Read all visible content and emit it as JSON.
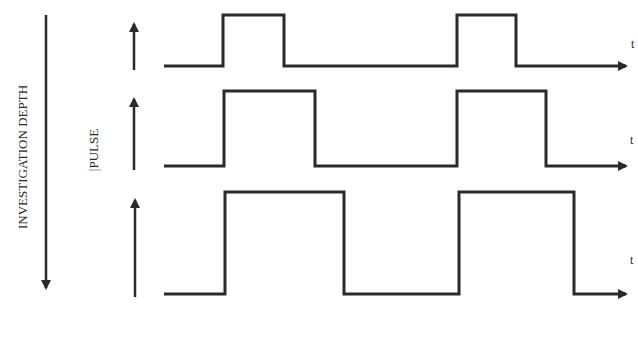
{
  "labels": {
    "depth_axis": "INVESTIGATION DEPTH",
    "pulse_axis": "|PULSE",
    "time_axis": "t"
  },
  "colors": {
    "stroke": "#2a2a2a",
    "background": "#ffffff"
  },
  "rows": [
    {
      "name": "shallow",
      "baseline_y": 66,
      "high_y": 15,
      "pulses": [
        [
          223,
          284
        ],
        [
          457,
          516
        ]
      ],
      "t_label": "t"
    },
    {
      "name": "middle",
      "baseline_y": 166,
      "high_y": 91,
      "pulses": [
        [
          224,
          315
        ],
        [
          457,
          546
        ]
      ],
      "t_label": "t"
    },
    {
      "name": "deep",
      "baseline_y": 294,
      "high_y": 192,
      "pulses": [
        [
          225,
          344
        ],
        [
          459,
          574
        ]
      ],
      "t_label": "t"
    }
  ]
}
